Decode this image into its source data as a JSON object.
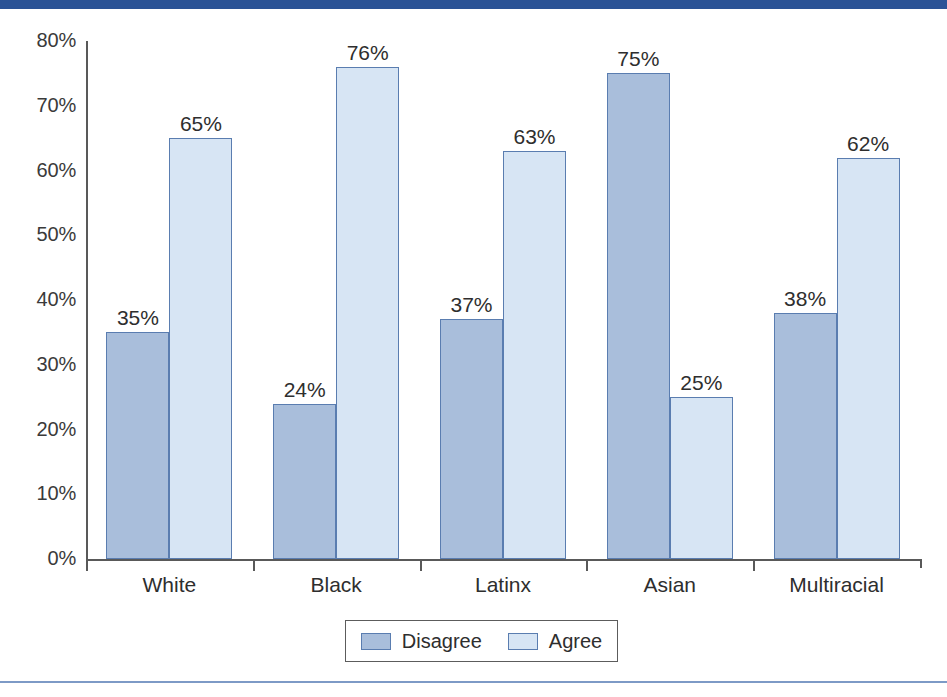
{
  "page": {
    "header_band_color": "#2b5396",
    "footer_rule_color": "#7d9ac6"
  },
  "chart_data": {
    "type": "bar",
    "title": "",
    "xlabel": "",
    "ylabel": "",
    "ylim": [
      0,
      80
    ],
    "grid": false,
    "legend_position": "bottom",
    "categories": [
      "White",
      "Black",
      "Latinx",
      "Asian",
      "Multiracial"
    ],
    "ytick_labels": [
      "80%",
      "70%",
      "60%",
      "50%",
      "40%",
      "30%",
      "20%",
      "10%",
      "0%"
    ],
    "ytick_values": [
      80,
      70,
      60,
      50,
      40,
      30,
      20,
      10,
      0
    ],
    "series": [
      {
        "name": "Disagree",
        "color": "#a9bedb",
        "values": [
          35,
          24,
          37,
          75,
          38
        ],
        "labels": [
          "35%",
          "24%",
          "37%",
          "75%",
          "38%"
        ]
      },
      {
        "name": "Agree",
        "color": "#d7e5f4",
        "values": [
          65,
          76,
          63,
          25,
          62
        ],
        "labels": [
          "65%",
          "76%",
          "63%",
          "25%",
          "62%"
        ]
      }
    ]
  }
}
